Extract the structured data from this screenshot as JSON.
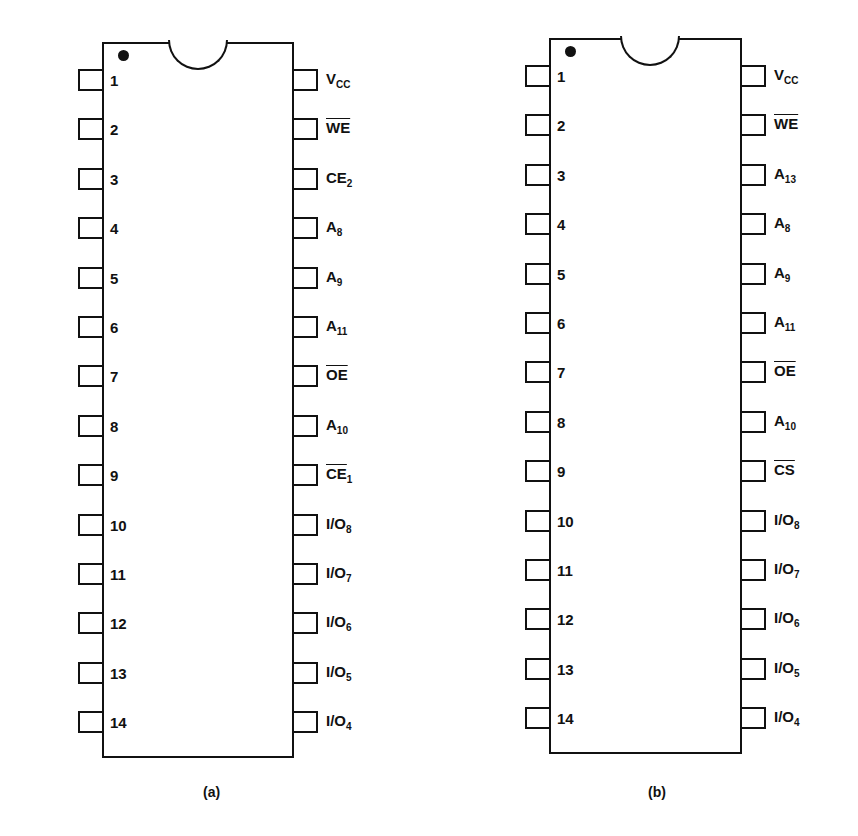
{
  "figure": {
    "chips": [
      {
        "id": "a",
        "caption": "(a)",
        "left_pins": [
          {
            "num": "1",
            "name": "NC",
            "sub": "",
            "overline": false
          },
          {
            "num": "2",
            "name": "A",
            "sub": "12",
            "overline": false
          },
          {
            "num": "3",
            "name": "A",
            "sub": "7",
            "overline": false
          },
          {
            "num": "4",
            "name": "A",
            "sub": "6",
            "overline": false
          },
          {
            "num": "5",
            "name": "A",
            "sub": "5",
            "overline": false
          },
          {
            "num": "6",
            "name": "A",
            "sub": "4",
            "overline": false
          },
          {
            "num": "7",
            "name": "A",
            "sub": "3",
            "overline": false
          },
          {
            "num": "8",
            "name": "A",
            "sub": "2",
            "overline": false
          },
          {
            "num": "9",
            "name": "A",
            "sub": "1",
            "overline": false
          },
          {
            "num": "10",
            "name": "A",
            "sub": "0",
            "overline": false
          },
          {
            "num": "11",
            "name": "I/O",
            "sub": "1",
            "overline": false
          },
          {
            "num": "12",
            "name": "I/O",
            "sub": "2",
            "overline": false
          },
          {
            "num": "13",
            "name": "I/O",
            "sub": "3",
            "overline": false
          },
          {
            "num": "14",
            "name": "GND",
            "sub": "",
            "overline": false
          }
        ],
        "right_pins": [
          {
            "num": "28",
            "name": "V",
            "sub": "CC",
            "overline": false
          },
          {
            "num": "27",
            "name": "WE",
            "sub": "",
            "overline": true
          },
          {
            "num": "26",
            "name": "CE",
            "sub": "2",
            "overline": false
          },
          {
            "num": "25",
            "name": "A",
            "sub": "8",
            "overline": false
          },
          {
            "num": "24",
            "name": "A",
            "sub": "9",
            "overline": false
          },
          {
            "num": "23",
            "name": "A",
            "sub": "11",
            "overline": false
          },
          {
            "num": "22",
            "name": "OE",
            "sub": "",
            "overline": true
          },
          {
            "num": "21",
            "name": "A",
            "sub": "10",
            "overline": false
          },
          {
            "num": "20",
            "name": "CE",
            "sub": "1",
            "overline": true
          },
          {
            "num": "19",
            "name": "I/O",
            "sub": "8",
            "overline": false
          },
          {
            "num": "18",
            "name": "I/O",
            "sub": "7",
            "overline": false
          },
          {
            "num": "17",
            "name": "I/O",
            "sub": "6",
            "overline": false
          },
          {
            "num": "16",
            "name": "I/O",
            "sub": "5",
            "overline": false
          },
          {
            "num": "15",
            "name": "I/O",
            "sub": "4",
            "overline": false
          }
        ]
      },
      {
        "id": "b",
        "caption": "(b)",
        "left_pins": [
          {
            "num": "1",
            "name": "A",
            "sub": "14",
            "overline": false
          },
          {
            "num": "2",
            "name": "A",
            "sub": "12",
            "overline": false
          },
          {
            "num": "3",
            "name": "A",
            "sub": "7",
            "overline": false
          },
          {
            "num": "4",
            "name": "A",
            "sub": "6",
            "overline": false
          },
          {
            "num": "5",
            "name": "A",
            "sub": "5",
            "overline": false
          },
          {
            "num": "6",
            "name": "A",
            "sub": "4",
            "overline": false
          },
          {
            "num": "7",
            "name": "A",
            "sub": "3",
            "overline": false
          },
          {
            "num": "8",
            "name": "A",
            "sub": "2",
            "overline": false
          },
          {
            "num": "9",
            "name": "A",
            "sub": "1",
            "overline": false
          },
          {
            "num": "10",
            "name": "A",
            "sub": "0",
            "overline": false
          },
          {
            "num": "11",
            "name": "I/O",
            "sub": "1",
            "overline": false
          },
          {
            "num": "12",
            "name": "I/O",
            "sub": "2",
            "overline": false
          },
          {
            "num": "13",
            "name": "I/O",
            "sub": "3",
            "overline": false
          },
          {
            "num": "14",
            "name": "GND",
            "sub": "",
            "overline": false
          }
        ],
        "right_pins": [
          {
            "num": "28",
            "name": "V",
            "sub": "CC",
            "overline": false
          },
          {
            "num": "27",
            "name": "WE",
            "sub": "",
            "overline": true
          },
          {
            "num": "26",
            "name": "A",
            "sub": "13",
            "overline": false
          },
          {
            "num": "25",
            "name": "A",
            "sub": "8",
            "overline": false
          },
          {
            "num": "24",
            "name": "A",
            "sub": "9",
            "overline": false
          },
          {
            "num": "23",
            "name": "A",
            "sub": "11",
            "overline": false
          },
          {
            "num": "22",
            "name": "OE",
            "sub": "",
            "overline": true
          },
          {
            "num": "21",
            "name": "A",
            "sub": "10",
            "overline": false
          },
          {
            "num": "20",
            "name": "CS",
            "sub": "",
            "overline": true
          },
          {
            "num": "19",
            "name": "I/O",
            "sub": "8",
            "overline": false
          },
          {
            "num": "18",
            "name": "I/O",
            "sub": "7",
            "overline": false
          },
          {
            "num": "17",
            "name": "I/O",
            "sub": "6",
            "overline": false
          },
          {
            "num": "16",
            "name": "I/O",
            "sub": "5",
            "overline": false
          },
          {
            "num": "15",
            "name": "I/O",
            "sub": "4",
            "overline": false
          }
        ]
      }
    ]
  },
  "layout": {
    "stroke_color": "#111111",
    "background": "#ffffff"
  }
}
